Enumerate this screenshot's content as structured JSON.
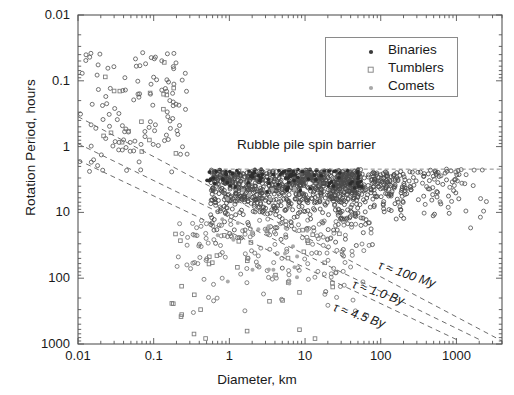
{
  "axes": {
    "xlabel": "Diameter, km",
    "ylabel": "Rotation Period, hours",
    "xticks": [
      "0.01",
      "0.1",
      "1",
      "10",
      "100",
      "1000"
    ],
    "yticks": [
      "0.01",
      "0.1",
      "1",
      "10",
      "100",
      "1000"
    ]
  },
  "legend": {
    "items": [
      {
        "label": "Binaries",
        "marker": "filled-dot",
        "color": "#3a3a3a"
      },
      {
        "label": "Tumblers",
        "marker": "open-square",
        "color": "#7a7a7a"
      },
      {
        "label": "Comets",
        "marker": "gray-dot",
        "color": "#9a9a9a"
      }
    ]
  },
  "annotations": {
    "barrier": "Rubble pile spin barrier",
    "tau_100my": "τ ≈ 100 My",
    "tau_1by": "τ ≈ 1.0 By",
    "tau_45by": "τ ≈ 4.5 By"
  },
  "chart_data": {
    "type": "scatter",
    "title": "",
    "xlabel": "Diameter, km",
    "ylabel": "Rotation Period, hours",
    "xscale": "log",
    "yscale": "log",
    "y_inverted": true,
    "xlim": [
      0.01,
      4000
    ],
    "ylim": [
      0.01,
      1000
    ],
    "xticks": [
      0.01,
      0.1,
      1,
      10,
      100,
      1000
    ],
    "yticks": [
      0.01,
      0.1,
      1,
      10,
      100,
      1000
    ],
    "grid": false,
    "legend_position": "top-right",
    "series": [
      {
        "name": "Asteroids",
        "marker": "open-circle",
        "color": "#4a4a4a",
        "n_points": 1400,
        "description": "Main population; dense cluster between 0.6 and 300 km diameter with periods 2 to 30 hours, bounded above by the rubble pile spin barrier near 2.2 hours.",
        "points": [
          [
            0.012,
            0.05
          ],
          [
            0.03,
            0.022
          ],
          [
            0.035,
            0.035
          ],
          [
            0.04,
            0.1
          ],
          [
            0.045,
            0.065
          ],
          [
            0.05,
            0.3
          ],
          [
            0.055,
            0.07
          ],
          [
            0.06,
            0.16
          ],
          [
            0.065,
            0.45
          ],
          [
            0.07,
            0.9
          ],
          [
            0.075,
            0.05
          ],
          [
            0.08,
            0.2
          ],
          [
            0.085,
            0.5
          ],
          [
            0.09,
            1.4
          ],
          [
            0.095,
            0.12
          ],
          [
            0.1,
            0.03
          ],
          [
            0.11,
            0.25
          ],
          [
            0.12,
            0.7
          ],
          [
            0.13,
            1.8
          ],
          [
            0.14,
            0.09
          ],
          [
            0.15,
            0.4
          ],
          [
            0.16,
            2.5
          ],
          [
            0.17,
            0.6
          ],
          [
            0.18,
            1.1
          ],
          [
            0.2,
            3.0
          ],
          [
            0.22,
            1.5
          ],
          [
            0.25,
            4.0
          ],
          [
            0.28,
            2.0
          ],
          [
            0.3,
            5.5
          ],
          [
            0.35,
            3.2
          ],
          [
            0.4,
            7.0
          ],
          [
            0.45,
            2.4
          ],
          [
            0.5,
            2.3
          ],
          [
            0.6,
            2.2
          ],
          [
            0.7,
            2.3
          ],
          [
            0.8,
            2.5
          ],
          [
            1.0,
            2.4
          ],
          [
            1.2,
            3.0
          ],
          [
            1.5,
            2.6
          ],
          [
            2.0,
            3.5
          ],
          [
            2.5,
            2.8
          ],
          [
            3.0,
            4.5
          ],
          [
            4.0,
            3.2
          ],
          [
            5.0,
            6.0
          ],
          [
            6.0,
            4.0
          ],
          [
            8.0,
            5.5
          ],
          [
            10,
            7.0
          ],
          [
            12,
            4.8
          ],
          [
            15,
            9.0
          ],
          [
            20,
            6.5
          ],
          [
            25,
            12
          ],
          [
            30,
            8.0
          ],
          [
            40,
            10
          ],
          [
            50,
            14
          ],
          [
            60,
            9.0
          ],
          [
            80,
            11
          ],
          [
            100,
            13
          ],
          [
            120,
            8.5
          ],
          [
            150,
            16
          ],
          [
            200,
            12
          ],
          [
            250,
            18
          ],
          [
            300,
            10
          ],
          [
            400,
            14
          ],
          [
            600,
            9.0
          ],
          [
            900,
            11
          ],
          [
            1500,
            8.0
          ],
          [
            2500,
            10
          ]
        ]
      },
      {
        "name": "Binaries",
        "marker": "filled-dot",
        "color": "#3a3a3a",
        "n_points": 90,
        "description": "Filled dots concentrated just below the spin barrier at 2.2-3 hours, diameters 0.3 to 20 km.",
        "points": [
          [
            0.35,
            2.5
          ],
          [
            0.5,
            2.4
          ],
          [
            0.7,
            2.3
          ],
          [
            0.9,
            2.4
          ],
          [
            1.2,
            2.5
          ],
          [
            1.6,
            2.6
          ],
          [
            2.2,
            2.4
          ],
          [
            3.0,
            2.7
          ],
          [
            4.5,
            2.5
          ],
          [
            6.0,
            2.8
          ],
          [
            9.0,
            2.6
          ],
          [
            14,
            3.0
          ],
          [
            20,
            2.9
          ],
          [
            30,
            3.4
          ]
        ]
      },
      {
        "name": "Tumblers",
        "marker": "open-square",
        "color": "#7a7a7a",
        "n_points": 60,
        "description": "Open squares, mostly long-period slow rotators below the tau lines; diameters 0.02 to 30 km, periods 10 to 1000 hours.",
        "points": [
          [
            0.022,
            0.06
          ],
          [
            0.04,
            0.07
          ],
          [
            0.06,
            1.2
          ],
          [
            0.09,
            1.0
          ],
          [
            0.15,
            3.0
          ],
          [
            0.3,
            12
          ],
          [
            0.5,
            30
          ],
          [
            0.8,
            60
          ],
          [
            1.2,
            100
          ],
          [
            2.0,
            200
          ],
          [
            3.0,
            150
          ],
          [
            5.0,
            400
          ],
          [
            8.0,
            250
          ],
          [
            12,
            500
          ],
          [
            20,
            300
          ],
          [
            30,
            1000
          ]
        ]
      },
      {
        "name": "Comets",
        "marker": "gray-dot",
        "color": "#9a9a9a",
        "n_points": 25,
        "description": "Light gray dots scattered at 1-10 km diameter with periods 5 to 100 hours.",
        "points": [
          [
            0.9,
            8
          ],
          [
            1.5,
            12
          ],
          [
            2.2,
            20
          ],
          [
            3.0,
            30
          ],
          [
            4.0,
            15
          ],
          [
            5.5,
            40
          ],
          [
            7.0,
            25
          ],
          [
            9.0,
            60
          ]
        ]
      }
    ],
    "reference_lines": [
      {
        "name": "Rubble pile spin barrier",
        "style": "dashed-horizontal",
        "y": 2.2,
        "x_from": 0.55,
        "x_to": 4000,
        "label": "Rubble pile spin barrier"
      },
      {
        "name": "tau = 100 My",
        "style": "dashed",
        "label": "τ ≈ 100 My",
        "from": [
          0.01,
          0.35
        ],
        "to": [
          4000,
          900
        ]
      },
      {
        "name": "tau = 1.0 By",
        "style": "dashed",
        "label": "τ ≈ 1.0 By",
        "from": [
          0.01,
          0.9
        ],
        "to": [
          2200,
          900
        ]
      },
      {
        "name": "tau = 4.5 By",
        "style": "dashed",
        "label": "τ ≈ 4.5 By",
        "from": [
          0.01,
          1.6
        ],
        "to": [
          1100,
          900
        ]
      }
    ]
  }
}
